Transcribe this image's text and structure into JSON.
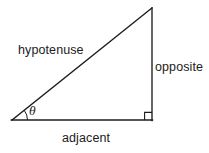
{
  "diagram": {
    "kind": "right-triangle-trigonometry",
    "background_color": "#ffffff",
    "stroke_color": "#1b1b1b",
    "stroke_width": 1.3,
    "canvas": {
      "width": 209,
      "height": 153
    },
    "vertices": {
      "angle_vertex": {
        "x": 12,
        "y": 120
      },
      "right_angle_vertex": {
        "x": 152,
        "y": 120
      },
      "apex_vertex": {
        "x": 152,
        "y": 8
      }
    },
    "sides": [
      {
        "name": "hypotenuse",
        "label": "hypotenuse",
        "from": {
          "x": 12,
          "y": 120
        },
        "to": {
          "x": 152,
          "y": 8
        }
      },
      {
        "name": "opposite",
        "label": "opposite",
        "from": {
          "x": 152,
          "y": 8
        },
        "to": {
          "x": 152,
          "y": 120
        }
      },
      {
        "name": "adjacent",
        "label": "adjacent",
        "from": {
          "x": 12,
          "y": 120
        },
        "to": {
          "x": 152,
          "y": 120
        }
      }
    ],
    "angle_marker": {
      "symbol": "θ",
      "arc_radius": 15,
      "at": {
        "x": 12,
        "y": 120
      }
    },
    "right_angle_marker": {
      "size": 7,
      "at": {
        "x": 152,
        "y": 120
      }
    }
  },
  "labels": {
    "hypotenuse": "hypotenuse",
    "opposite": "opposite",
    "adjacent": "adjacent",
    "theta": "θ"
  }
}
